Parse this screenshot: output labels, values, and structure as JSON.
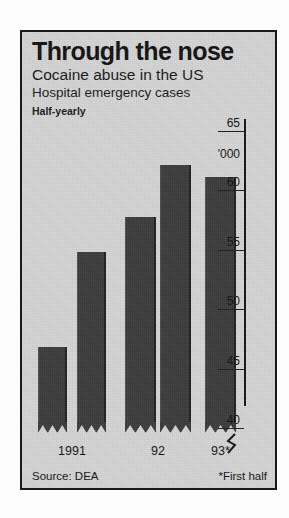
{
  "panel": {
    "title": "Through the nose",
    "subtitle": "Cocaine abuse in the US",
    "subtitle2": "Hospital emergency cases",
    "frequency_note": "Half-yearly",
    "source": "Source: DEA",
    "footnote": "*First half",
    "unit_label": "'000",
    "background_color": "#d6d6d6",
    "bar_color": "#3b3b3b",
    "border_color": "#1a1a1a"
  },
  "chart_data": {
    "type": "bar",
    "title": "Through the nose",
    "subtitle": "Cocaine abuse in the US",
    "xlabel": "",
    "ylabel": "'000",
    "ylim": [
      38,
      66
    ],
    "axis_break": true,
    "grid": false,
    "legend": "none",
    "source": "Source: DEA",
    "footnote": "*First half",
    "yticks": [
      40,
      45,
      50,
      55,
      60,
      65
    ],
    "ytick_labels": [
      "40",
      "45",
      "50",
      "55",
      "60",
      "65"
    ],
    "categories": [
      "1991 H1",
      "1991 H2",
      "92 H1",
      "92 H2",
      "93*"
    ],
    "period_labels": [
      "1991",
      "92",
      "93*"
    ],
    "values": [
      46.8,
      54.8,
      57.7,
      62.1,
      61.1
    ],
    "value_labels": [
      "46.8",
      "54.8",
      "57.7",
      "62.1",
      "61.1"
    ]
  }
}
